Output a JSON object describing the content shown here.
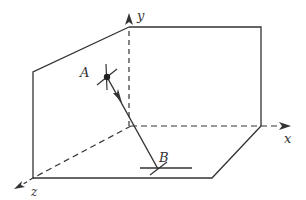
{
  "figure": {
    "stroke_color": "#333333",
    "background": "#ffffff"
  },
  "axes": {
    "x": {
      "label": "x"
    },
    "y": {
      "label": "y"
    },
    "z": {
      "label": "z"
    }
  },
  "points": {
    "A": {
      "label": "A"
    },
    "B": {
      "label": "B"
    }
  }
}
